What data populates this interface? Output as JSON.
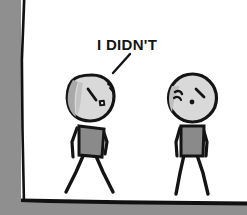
{
  "panel": {
    "title": "Comic strip panel",
    "background_color": "#ffffff",
    "page_shadow_color": "#8f8f8f",
    "border_color": "#111111",
    "width": 247,
    "height": 215
  },
  "dialogue": {
    "speaker": "left-character",
    "text": "I DIDN'T",
    "text_color": "#151515",
    "tail": "pointer-line-to-left-character"
  },
  "characters": [
    {
      "id": "left-character",
      "name": "left-character",
      "pose": "head-tilted",
      "expression": "worried-denial",
      "head_fill": "#d9d9d9",
      "head_shading": "#a8a8a8",
      "torso_fill": "#8a8a8a",
      "outline_color": "#141414",
      "eye": "square-eye",
      "eyebrow": "angled-eyebrow",
      "limbs": "stick-arms-and-legs"
    },
    {
      "id": "right-character",
      "name": "right-character",
      "pose": "upright",
      "expression": "skeptical-sad",
      "head_fill": "#d9d9d9",
      "head_shading": "#b4b4b4",
      "torso_fill": "#8a8a8a",
      "outline_color": "#141414",
      "eye": "dot-eye",
      "eyebrow": "two-slanted-eyebrows",
      "limbs": "stick-arms-and-legs"
    }
  ]
}
